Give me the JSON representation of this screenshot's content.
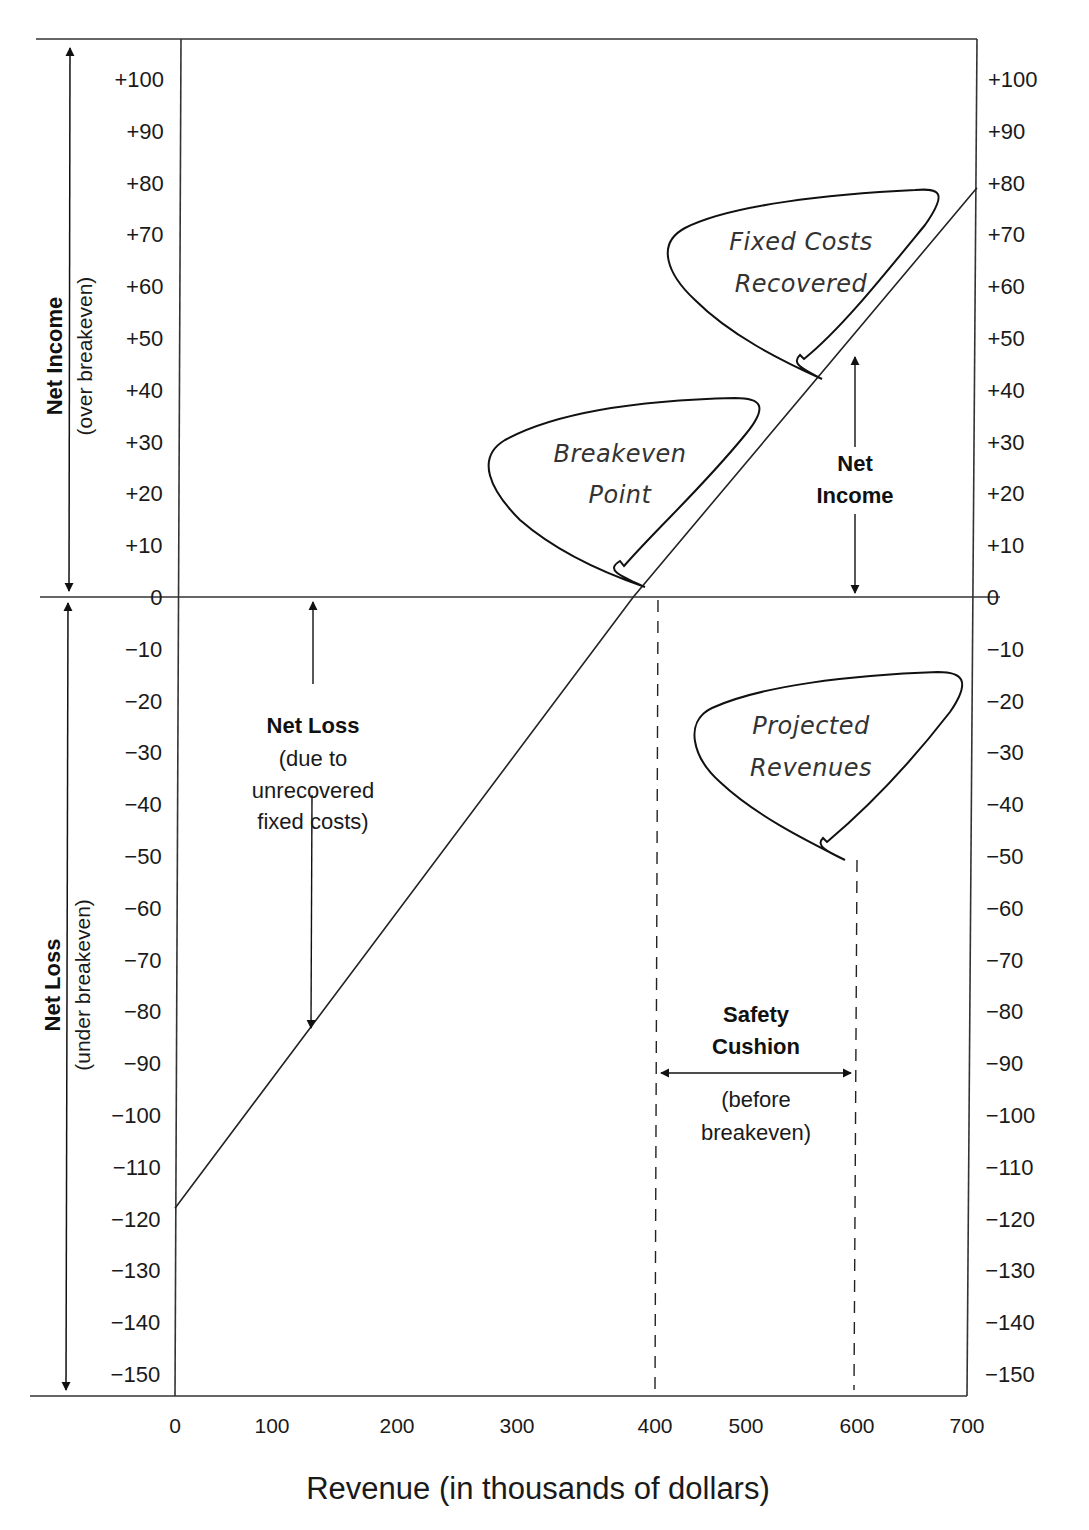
{
  "chart_data": {
    "type": "line",
    "title": "",
    "xlabel": "Revenue (in thousands of dollars)",
    "ylabel_top": "Net Income",
    "ylabel_top_sub": "(over breakeven)",
    "ylabel_bottom": "Net Loss",
    "ylabel_bottom_sub": "(under breakeven)",
    "x_ticks": [
      "0",
      "100",
      "200",
      "300",
      "400",
      "500",
      "600",
      "700"
    ],
    "y_ticks_left": [
      "+100",
      "+90",
      "+80",
      "+70",
      "+60",
      "+50",
      "+40",
      "+30",
      "+20",
      "+10",
      "0",
      "−10",
      "−20",
      "−30",
      "−40",
      "−50",
      "−60",
      "−70",
      "−80",
      "−90",
      "−100",
      "−110",
      "−120",
      "−130",
      "−140",
      "−150"
    ],
    "y_ticks_right": [
      "+100",
      "+90",
      "+80",
      "+70",
      "+60",
      "+50",
      "+40",
      "+30",
      "+20",
      "+10",
      "0",
      "−10",
      "−20",
      "−30",
      "−40",
      "−50",
      "−60",
      "−70",
      "−80",
      "−90",
      "−100",
      "−110",
      "−120",
      "−130",
      "−140",
      "−150"
    ],
    "xlim": [
      0,
      700
    ],
    "ylim": [
      -150,
      100
    ],
    "grid": false,
    "series": [
      {
        "name": "Net income / loss",
        "x": [
          0,
          400,
          700
        ],
        "y": [
          -118,
          0,
          79
        ]
      }
    ],
    "reference_lines": [
      {
        "type": "horizontal",
        "y": 0,
        "label": "Breakeven"
      },
      {
        "type": "vertical-dashed",
        "x": 400,
        "label": "Breakeven revenue"
      },
      {
        "type": "vertical-dashed",
        "x": 600,
        "label": "Projected revenues"
      }
    ],
    "annotations": {
      "net_loss": {
        "title": "Net Loss",
        "lines": [
          "(due to",
          "unrecovered",
          "fixed costs)"
        ]
      },
      "net_income": {
        "lines": [
          "Net",
          "Income"
        ]
      },
      "safety_cushion": {
        "title_lines": [
          "Safety",
          "Cushion"
        ],
        "sub_lines": [
          "(before",
          "breakeven)"
        ]
      },
      "callouts": [
        {
          "lines": [
            "Breakeven",
            "Point"
          ],
          "points_to": {
            "x": 400,
            "y": 0
          }
        },
        {
          "lines": [
            "Fixed Costs",
            "Recovered"
          ],
          "points_to": {
            "x": 560,
            "y": 43
          }
        },
        {
          "lines": [
            "Projected",
            "Revenues"
          ],
          "points_to": {
            "x": 600,
            "y": -50
          }
        }
      ]
    }
  }
}
